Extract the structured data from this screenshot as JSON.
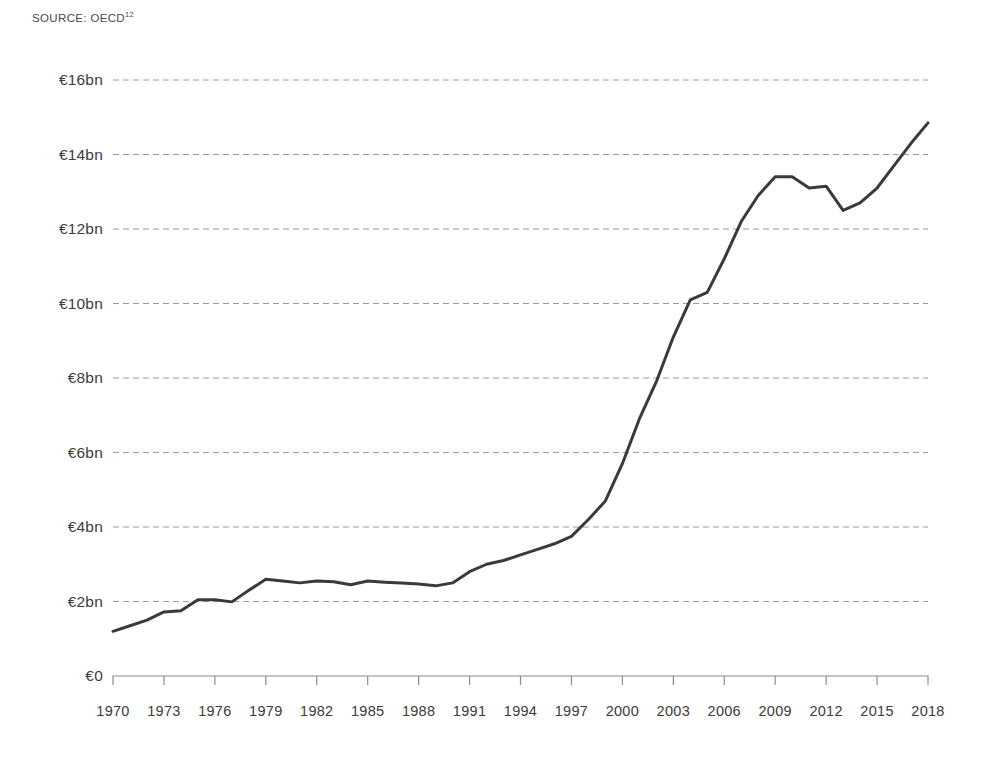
{
  "source": {
    "prefix": "SOURCE: OECD",
    "footnote": "12"
  },
  "colors": {
    "line": "#3a3a3a",
    "grid": "#9a9a9a",
    "axis": "#8c8c8c",
    "text": "#3b3b3b",
    "background": "#ffffff"
  },
  "chart_data": {
    "type": "line",
    "title": "",
    "subtitle": "",
    "xlabel": "",
    "ylabel": "",
    "xlim": [
      1970,
      2018
    ],
    "ylim": [
      0,
      16
    ],
    "grid": true,
    "legend": false,
    "y_tick_labels": [
      "€16bn",
      "€14bn",
      "€12bn",
      "€10bn",
      "€8bn",
      "€6bn",
      "€4bn",
      "€2bn",
      "€0"
    ],
    "y_tick_values": [
      16,
      14,
      12,
      10,
      8,
      6,
      4,
      2,
      0
    ],
    "x_tick_labels": [
      "1970",
      "1973",
      "1976",
      "1979",
      "1982",
      "1985",
      "1988",
      "1991",
      "1994",
      "1997",
      "2000",
      "2003",
      "2006",
      "2009",
      "2012",
      "2015",
      "2018"
    ],
    "x_tick_values": [
      1970,
      1973,
      1976,
      1979,
      1982,
      1985,
      1988,
      1991,
      1994,
      1997,
      2000,
      2003,
      2006,
      2009,
      2012,
      2015,
      2018
    ],
    "units": "€ billions",
    "series": [
      {
        "name": "Value",
        "x": [
          1970,
          1971,
          1972,
          1973,
          1974,
          1975,
          1976,
          1977,
          1978,
          1979,
          1980,
          1981,
          1982,
          1983,
          1984,
          1985,
          1986,
          1987,
          1988,
          1989,
          1990,
          1991,
          1992,
          1993,
          1994,
          1995,
          1996,
          1997,
          1998,
          1999,
          2000,
          2001,
          2002,
          2003,
          2004,
          2005,
          2006,
          2007,
          2008,
          2009,
          2010,
          2011,
          2012,
          2013,
          2014,
          2015,
          2016,
          2017,
          2018
        ],
        "values": [
          1.2,
          1.35,
          1.5,
          1.72,
          1.75,
          2.05,
          2.05,
          1.99,
          2.3,
          2.6,
          2.55,
          2.5,
          2.55,
          2.53,
          2.45,
          2.55,
          2.52,
          2.5,
          2.47,
          2.42,
          2.5,
          2.8,
          3.0,
          3.1,
          3.25,
          3.4,
          3.55,
          3.75,
          4.2,
          4.7,
          5.7,
          6.9,
          7.9,
          9.1,
          10.1,
          10.3,
          11.2,
          12.2,
          12.9,
          13.4,
          13.4,
          13.1,
          13.15,
          12.5,
          12.7,
          13.1,
          13.7,
          14.3,
          14.85
        ]
      }
    ]
  },
  "layout": {
    "plot_left": 113,
    "plot_right": 928,
    "plot_top": 80,
    "plot_bottom": 676,
    "ytick_label_right": 103,
    "xtick_label_top": 703,
    "tick_length": 9
  }
}
